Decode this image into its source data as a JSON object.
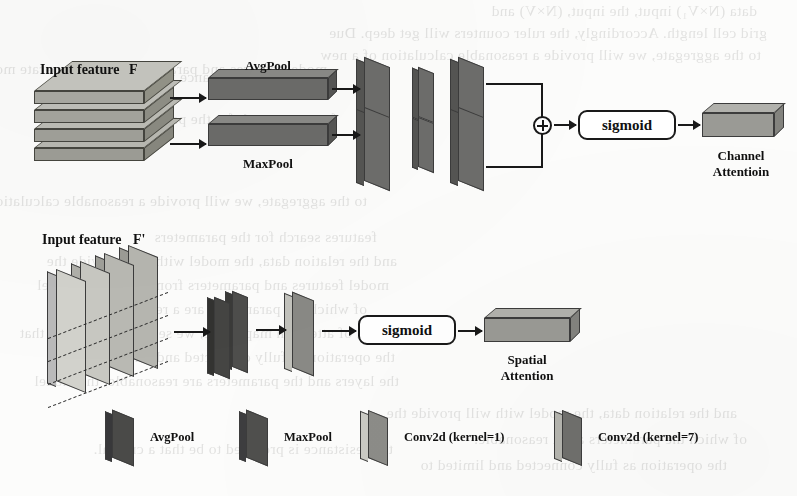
{
  "figure": {
    "type": "diagram",
    "channel_branch": {
      "input_label": "Input feature",
      "input_symbol": "F",
      "pool_avg": "AvgPool",
      "pool_max": "MaxPool",
      "merge_op": "⊕",
      "activation": "sigmoid",
      "output_line1": "Channel",
      "output_line2": "Attentioin"
    },
    "spatial_branch": {
      "input_label": "Input feature",
      "input_symbol": "F'",
      "activation": "sigmoid",
      "output_line1": "Spatial",
      "output_line2": "Attention"
    },
    "legend": {
      "items": [
        {
          "label": "AvgPool",
          "icon": "dark-plate-icon",
          "color": "#4a4a4a"
        },
        {
          "label": "MaxPool",
          "icon": "dark-plate-icon",
          "color": "#4f4f4f"
        },
        {
          "label": "Conv2d (kernel=1)",
          "icon": "light-plate-icon",
          "color": "#b9b9b4"
        },
        {
          "label": "Conv2d (kernel=7)",
          "icon": "mid-plate-icon",
          "color": "#7d7d79"
        }
      ]
    },
    "colors": {
      "paper": "#fcfcfb",
      "ink": "#1a1a1a",
      "slab_dark": "#6e6e6c",
      "slab_darker": "#4a4a48",
      "slab_light": "#b4b4ae",
      "slab_mid": "#8e8e8a"
    }
  },
  "bleedthrough": {
    "lines": [
      "data (N×V₁) input, the input, (N×V) and",
      "grid cell length. Accordingly, the ruler counters will get deep. Due",
      "to the aggregate, we will provide a reasonable calculation of a new",
      "and the resistance provides the data.",
      "features search for the parameters",
      "and the relation data, the model with will provide the",
      "model features and parameters from a separate model",
      "of which the parameters are a reasonable.",
      "tion of attention map. Here, we set V-EB, meaning that",
      "the operation as fully connected and limited to",
      "the layers and the parameters are reasonable, the model",
      "the resistance is provided to be that a critical."
    ]
  }
}
